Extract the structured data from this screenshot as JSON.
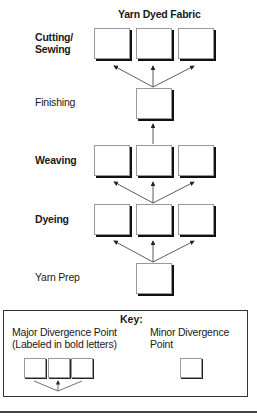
{
  "diagram": {
    "title": "Yarn Dyed Fabric",
    "stages": [
      {
        "label": "Cutting/ Sewing",
        "bold": true,
        "boxes": 3
      },
      {
        "label": "Finishing",
        "bold": false,
        "boxes": 1
      },
      {
        "label": "Weaving",
        "bold": true,
        "boxes": 3
      },
      {
        "label": "Dyeing",
        "bold": true,
        "boxes": 3
      },
      {
        "label": "Yarn Prep",
        "bold": false,
        "boxes": 1
      }
    ],
    "labels": {
      "cutting_line1": "Cutting/",
      "cutting_line2": "Sewing",
      "finishing": "Finishing",
      "weaving": "Weaving",
      "dyeing": "Dyeing",
      "yarn_prep": "Yarn Prep"
    }
  },
  "key": {
    "title": "Key:",
    "major_line1": "Major Divergence Point",
    "major_line2": "(Labeled in bold letters)",
    "minor": "Minor Divergence Point"
  }
}
